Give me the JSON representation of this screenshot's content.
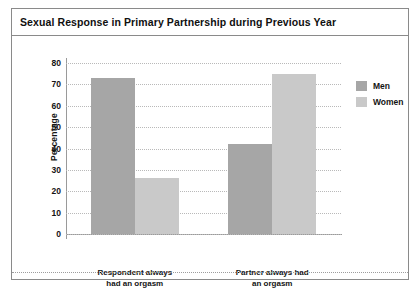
{
  "figure": {
    "title": "Sexual Response in Primary Partnership during Previous Year"
  },
  "legend": {
    "position": "top-right",
    "entries": [
      {
        "label": "Men",
        "color": "#a6a6a6"
      },
      {
        "label": "Women",
        "color": "#c9c9c9"
      }
    ]
  },
  "axes": {
    "ylabel": "Percentage",
    "yticks": [
      "80",
      "70",
      "60",
      "50",
      "40",
      "30",
      "20",
      "10",
      "0"
    ]
  },
  "categories": [
    {
      "line1": "Respondent always",
      "line2": "had an orgasm"
    },
    {
      "line1": "Partner always had",
      "line2": "an orgasm"
    }
  ],
  "chart_data": {
    "type": "bar",
    "title": "Sexual Response in Primary Partnership during Previous Year",
    "xlabel": "",
    "ylabel": "Percentage",
    "ylim": [
      0,
      80
    ],
    "ytick_step": 10,
    "yticks": [
      0,
      10,
      20,
      30,
      40,
      50,
      60,
      70,
      80
    ],
    "grid": true,
    "grid_style": "dotted-horizontal",
    "legend_position": "top-right",
    "categories": [
      "Respondent always had an orgasm",
      "Partner always had an orgasm"
    ],
    "series": [
      {
        "name": "Men",
        "color": "#a6a6a6",
        "values": [
          73,
          42
        ]
      },
      {
        "name": "Women",
        "color": "#c9c9c9",
        "values": [
          26,
          75
        ]
      }
    ]
  }
}
